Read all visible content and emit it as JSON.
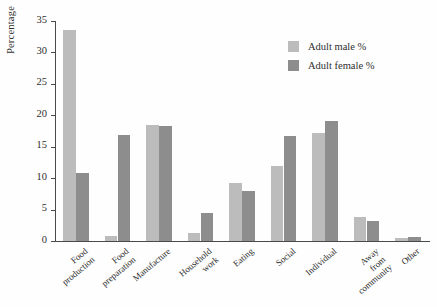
{
  "chart_data": {
    "type": "bar",
    "title": "",
    "xlabel": "",
    "ylabel": "Percentage",
    "ylim": [
      0,
      35
    ],
    "yticks": [
      0,
      5,
      10,
      15,
      20,
      25,
      30,
      35
    ],
    "grid": false,
    "legend_position": "top-right",
    "categories": [
      "Food production",
      "Food preparation",
      "Manufacture",
      "Household work",
      "Eating",
      "Social",
      "Individual",
      "Away from community",
      "Other"
    ],
    "series": [
      {
        "name": "Adult male %",
        "color": "#bcbcbc",
        "values": [
          33.5,
          0.8,
          18.5,
          1.3,
          9.3,
          11.9,
          17.2,
          3.8,
          0.5
        ]
      },
      {
        "name": "Adult female %",
        "color": "#8d8d8d",
        "values": [
          10.9,
          16.8,
          18.3,
          4.4,
          7.9,
          16.7,
          19.1,
          3.2,
          0.7
        ]
      }
    ]
  },
  "axis": {
    "y_title": "Percentage",
    "y_tick_labels": [
      "0",
      "5",
      "10",
      "15",
      "20",
      "25",
      "30",
      "35"
    ]
  },
  "legend": {
    "items": [
      {
        "label": "Adult male %",
        "swatch": "male"
      },
      {
        "label": "Adult female %",
        "swatch": "female"
      }
    ]
  }
}
